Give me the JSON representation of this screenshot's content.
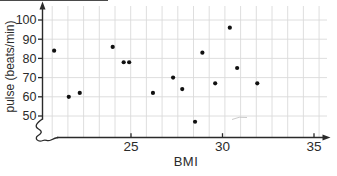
{
  "chart_data": {
    "type": "scatter",
    "title": "",
    "xlabel": "BMI",
    "ylabel": "pulse (beats/min)",
    "x_ticks": [
      25,
      30,
      35
    ],
    "y_ticks": [
      50,
      60,
      70,
      80,
      90,
      100
    ],
    "x_range_displayed": [
      20.2,
      35.8
    ],
    "y_range_displayed": [
      45,
      104
    ],
    "y_axis_break": true,
    "grid": true,
    "legend": "none",
    "points": [
      {
        "bmi": 20.8,
        "pulse": 84
      },
      {
        "bmi": 21.6,
        "pulse": 60
      },
      {
        "bmi": 22.2,
        "pulse": 62
      },
      {
        "bmi": 24.0,
        "pulse": 86
      },
      {
        "bmi": 24.6,
        "pulse": 78
      },
      {
        "bmi": 24.9,
        "pulse": 78
      },
      {
        "bmi": 26.2,
        "pulse": 62
      },
      {
        "bmi": 27.3,
        "pulse": 70
      },
      {
        "bmi": 27.8,
        "pulse": 64
      },
      {
        "bmi": 28.5,
        "pulse": 47
      },
      {
        "bmi": 28.9,
        "pulse": 83
      },
      {
        "bmi": 29.6,
        "pulse": 67
      },
      {
        "bmi": 30.4,
        "pulse": 96
      },
      {
        "bmi": 30.8,
        "pulse": 75
      },
      {
        "bmi": 31.9,
        "pulse": 67
      }
    ],
    "colors": {
      "point": "#111111",
      "axis": "#2a2a2a",
      "grid": "#dadada",
      "text": "#2b2b2b",
      "background": "#ffffff"
    }
  }
}
